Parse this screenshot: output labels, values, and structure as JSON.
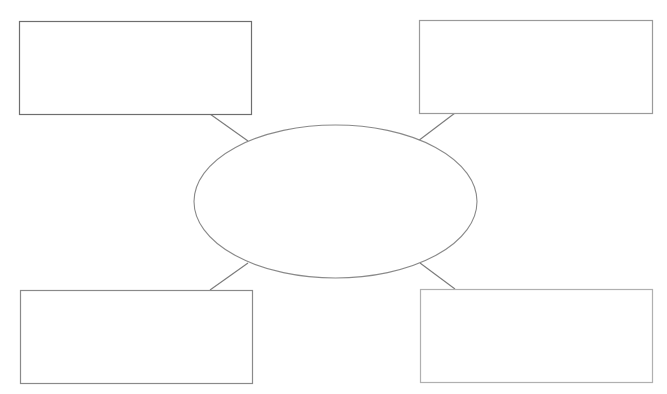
{
  "diagram": {
    "type": "concept-map",
    "center": {
      "label": "",
      "shape": "ellipse",
      "cx": 335.5,
      "cy": 201.5,
      "rx": 141.5,
      "ry": 76.5,
      "stroke": "#8a8a8a"
    },
    "nodes": [
      {
        "id": "top-left",
        "label": "",
        "x": 19,
        "y": 21,
        "w": 232,
        "h": 93,
        "stroke": "#6e6e6e"
      },
      {
        "id": "top-right",
        "label": "",
        "x": 419,
        "y": 20,
        "w": 233,
        "h": 93,
        "stroke": "#9a9a9a"
      },
      {
        "id": "bottom-left",
        "label": "",
        "x": 20,
        "y": 290,
        "w": 232,
        "h": 93,
        "stroke": "#8a8a8a"
      },
      {
        "id": "bottom-right",
        "label": "",
        "x": 420,
        "y": 289,
        "w": 232,
        "h": 93,
        "stroke": "#b0b0b0"
      }
    ],
    "connectors": [
      {
        "from": "top-left",
        "x1": 210,
        "y1": 114,
        "x2": 248,
        "y2": 141
      },
      {
        "from": "top-right",
        "x1": 455,
        "y1": 113,
        "x2": 418,
        "y2": 141
      },
      {
        "from": "bottom-left",
        "x1": 210,
        "y1": 290,
        "x2": 248,
        "y2": 263
      },
      {
        "from": "bottom-right",
        "x1": 455,
        "y1": 289,
        "x2": 420,
        "y2": 263
      }
    ]
  }
}
